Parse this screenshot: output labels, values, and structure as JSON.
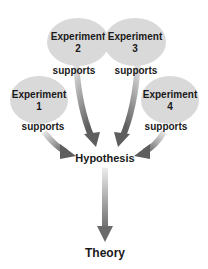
{
  "diagram": {
    "experiments": [
      {
        "title": "Experiment",
        "number": "1",
        "relation": "supports"
      },
      {
        "title": "Experiment",
        "number": "2",
        "relation": "supports"
      },
      {
        "title": "Experiment",
        "number": "3",
        "relation": "supports"
      },
      {
        "title": "Experiment",
        "number": "4",
        "relation": "supports"
      }
    ],
    "hypothesis": "Hypothesis",
    "theory": "Theory",
    "colors": {
      "ellipse_fill": "#d9d9d9",
      "arrow_light": "#e8e8e8",
      "arrow_dark": "#6e6e6e",
      "text": "#1a1a1a"
    }
  }
}
